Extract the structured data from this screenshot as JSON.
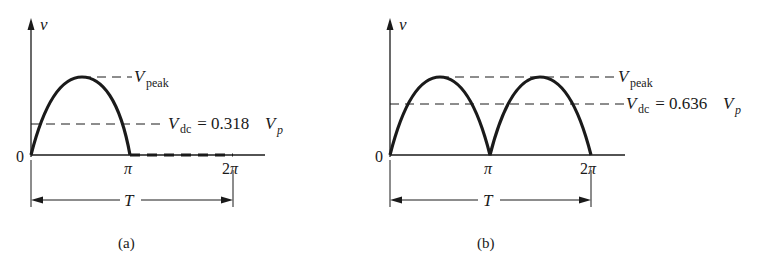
{
  "panels": [
    {
      "id": "a",
      "caption": "(a)",
      "title": "Half-wave rectified waveform",
      "y_axis_label": "v",
      "origin_label": "0",
      "x_ticks": [
        "π",
        "2π"
      ],
      "period_label": "T",
      "peak_label_main": "V",
      "peak_label_sub": "peak",
      "dc_label_main": "V",
      "dc_label_sub": "dc",
      "dc_label_eq": " = 0.318",
      "dc_label_vp": "V",
      "dc_label_vp_sub": "p",
      "dc_coefficient": 0.318
    },
    {
      "id": "b",
      "caption": "(b)",
      "title": "Full-wave rectified waveform",
      "y_axis_label": "v",
      "origin_label": "0",
      "x_ticks": [
        "π",
        "2π"
      ],
      "period_label": "T",
      "peak_label_main": "V",
      "peak_label_sub": "peak",
      "dc_label_main": "V",
      "dc_label_sub": "dc",
      "dc_label_eq": " = 0.636",
      "dc_label_vp": "V",
      "dc_label_vp_sub": "p",
      "dc_coefficient": 0.636
    }
  ]
}
